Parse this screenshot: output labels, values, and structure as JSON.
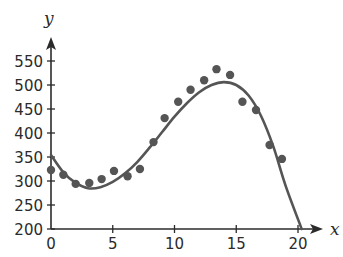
{
  "chart_data": {
    "type": "scatter",
    "title": "",
    "xlabel": "x",
    "ylabel": "y",
    "xlim": [
      0,
      21
    ],
    "ylim": [
      200,
      570
    ],
    "x_ticks": [
      0,
      5,
      10,
      15,
      20
    ],
    "y_ticks": [
      200,
      250,
      300,
      350,
      400,
      450,
      500,
      550
    ],
    "grid": false,
    "legend": null,
    "series": [
      {
        "name": "data points",
        "type": "scatter",
        "color": "#555555",
        "points": [
          [
            0,
            323
          ],
          [
            1,
            313
          ],
          [
            2,
            294
          ],
          [
            3.1,
            296
          ],
          [
            4.1,
            304
          ],
          [
            5.1,
            321
          ],
          [
            6.2,
            310
          ],
          [
            7.2,
            325
          ],
          [
            8.3,
            381
          ],
          [
            9.2,
            431
          ],
          [
            10.3,
            465
          ],
          [
            11.3,
            490
          ],
          [
            12.4,
            510
          ],
          [
            13.4,
            533
          ],
          [
            14.5,
            521
          ],
          [
            15.5,
            465
          ],
          [
            16.6,
            448
          ],
          [
            17.7,
            375
          ],
          [
            18.7,
            346
          ]
        ]
      },
      {
        "name": "fitted curve",
        "type": "line",
        "color": "#555555",
        "points": [
          [
            0,
            354
          ],
          [
            1,
            318
          ],
          [
            2,
            296
          ],
          [
            3,
            285
          ],
          [
            4,
            287
          ],
          [
            5,
            298
          ],
          [
            6,
            316
          ],
          [
            7,
            340
          ],
          [
            8,
            370
          ],
          [
            9,
            402
          ],
          [
            10,
            434
          ],
          [
            11,
            462
          ],
          [
            12,
            485
          ],
          [
            13,
            500
          ],
          [
            14,
            506
          ],
          [
            15,
            500
          ],
          [
            16,
            478
          ],
          [
            17,
            436
          ],
          [
            18,
            372
          ],
          [
            19,
            290
          ],
          [
            20.3,
            200
          ]
        ]
      }
    ]
  },
  "layout": {
    "origin_px": [
      51,
      229
    ],
    "x_px_per_unit": 12.35,
    "y_px_per_unit": 0.48,
    "y_min": 200,
    "x_axis_end_px": 323,
    "y_axis_top_px": 37
  }
}
